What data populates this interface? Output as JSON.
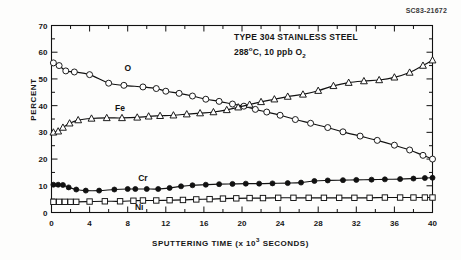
{
  "figure_id": "SC83-21672",
  "chart_data": {
    "type": "line",
    "title": "TYPE 304 STAINLESS STEEL",
    "subtitle": "288°C, 10 ppb O2",
    "subtitle_parts": {
      "temperature": "288",
      "degree_unit": "o",
      "celsius": "C, 10 ppb O",
      "oxygen_subscript": "2"
    },
    "xlabel": "SPUTTERING TIME (x 10",
    "xlabel_exponent": "3",
    "xlabel_tail": " SECONDS)",
    "xlabel_full": "SPUTTERING TIME (x 10^3 SECONDS)",
    "ylabel": "PERCENT",
    "xlim": [
      0,
      40
    ],
    "ylim": [
      0,
      70
    ],
    "xticks": [
      0,
      4,
      8,
      12,
      16,
      20,
      24,
      28,
      32,
      36,
      40
    ],
    "xticklabels": [
      "0",
      "4",
      "8",
      "12",
      "16",
      "20",
      "24",
      "28",
      "32",
      "36",
      "40"
    ],
    "yticks": [
      0,
      10,
      20,
      30,
      40,
      50,
      60,
      70
    ],
    "yticklabels": [
      "0",
      "10",
      "20",
      "30",
      "40",
      "50",
      "60",
      "70"
    ],
    "x_minor_interval": 2,
    "y_minor_interval": 5,
    "grid": false,
    "legend_position": "inline-labels",
    "series": [
      {
        "name": "O",
        "marker": "open-circle",
        "label_x": 8.0,
        "label_y": 54.0,
        "x": [
          0.2,
          0.8,
          1.5,
          2.4,
          4.0,
          6.0,
          7.6,
          9.6,
          11.0,
          12.0,
          13.4,
          14.8,
          16.2,
          17.6,
          19.0,
          20.2,
          21.4,
          22.6,
          24.0,
          25.6,
          27.2,
          29.0,
          30.6,
          32.4,
          34.2,
          36.0,
          37.6,
          39.0,
          40.0
        ],
        "y": [
          56.0,
          55.0,
          53.0,
          52.6,
          51.6,
          48.4,
          47.6,
          47.0,
          46.4,
          45.4,
          44.6,
          43.6,
          42.4,
          41.6,
          40.6,
          39.8,
          38.6,
          37.6,
          36.4,
          34.8,
          33.4,
          31.8,
          30.2,
          28.6,
          27.0,
          25.2,
          23.4,
          21.4,
          20.0
        ]
      },
      {
        "name": "Fe",
        "marker": "open-triangle",
        "label_x": 7.2,
        "label_y": 39.2,
        "x": [
          0.2,
          0.7,
          1.2,
          1.9,
          2.8,
          4.2,
          5.8,
          7.4,
          9.0,
          10.2,
          11.4,
          12.8,
          14.2,
          15.6,
          17.0,
          18.4,
          19.6,
          20.8,
          22.0,
          23.4,
          24.8,
          26.4,
          28.0,
          29.6,
          31.2,
          32.8,
          34.4,
          36.0,
          37.6,
          39.0,
          40.0
        ],
        "y": [
          30.0,
          30.4,
          31.8,
          33.4,
          34.6,
          35.2,
          35.4,
          35.4,
          35.6,
          36.0,
          36.2,
          36.4,
          36.8,
          37.2,
          37.6,
          38.4,
          39.4,
          40.4,
          41.4,
          42.4,
          43.4,
          44.2,
          45.6,
          47.4,
          48.6,
          49.2,
          49.6,
          50.6,
          52.4,
          55.0,
          57.0
        ]
      },
      {
        "name": "Cr",
        "marker": "filled-circle",
        "label_x": 9.6,
        "label_y": 12.8,
        "x": [
          0.2,
          0.7,
          1.2,
          1.8,
          2.6,
          3.6,
          5.0,
          6.6,
          8.0,
          8.8,
          10.0,
          11.2,
          12.4,
          13.6,
          14.8,
          16.2,
          17.6,
          19.0,
          20.4,
          21.8,
          23.2,
          24.8,
          26.2,
          27.6,
          29.0,
          30.6,
          32.0,
          33.6,
          35.0,
          36.6,
          38.0,
          39.2,
          40.0
        ],
        "y": [
          10.4,
          10.4,
          10.3,
          9.4,
          8.6,
          8.2,
          8.2,
          8.6,
          8.8,
          8.8,
          8.8,
          8.8,
          9.2,
          9.8,
          10.2,
          10.4,
          10.6,
          10.7,
          10.8,
          10.8,
          10.9,
          11.0,
          11.2,
          11.8,
          12.0,
          12.1,
          12.2,
          12.3,
          12.4,
          12.5,
          12.7,
          12.9,
          13.0
        ]
      },
      {
        "name": "Ni",
        "marker": "open-square",
        "label_x": 9.2,
        "label_y": 2.1,
        "x": [
          0.2,
          0.8,
          1.4,
          2.0,
          2.6,
          4.0,
          5.6,
          7.2,
          8.6,
          9.6,
          11.0,
          12.4,
          13.8,
          15.2,
          16.6,
          18.0,
          19.4,
          20.8,
          22.2,
          23.8,
          25.4,
          27.0,
          28.6,
          30.2,
          31.8,
          33.4,
          35.0,
          36.6,
          38.0,
          39.2,
          40.0
        ],
        "y": [
          4.0,
          4.0,
          4.0,
          4.0,
          4.0,
          4.1,
          4.2,
          4.2,
          4.4,
          4.5,
          4.5,
          4.6,
          4.7,
          4.9,
          5.0,
          5.2,
          5.3,
          5.4,
          5.4,
          5.5,
          5.5,
          5.5,
          5.5,
          5.5,
          5.5,
          5.5,
          5.6,
          5.6,
          5.6,
          5.6,
          5.6
        ]
      }
    ]
  }
}
